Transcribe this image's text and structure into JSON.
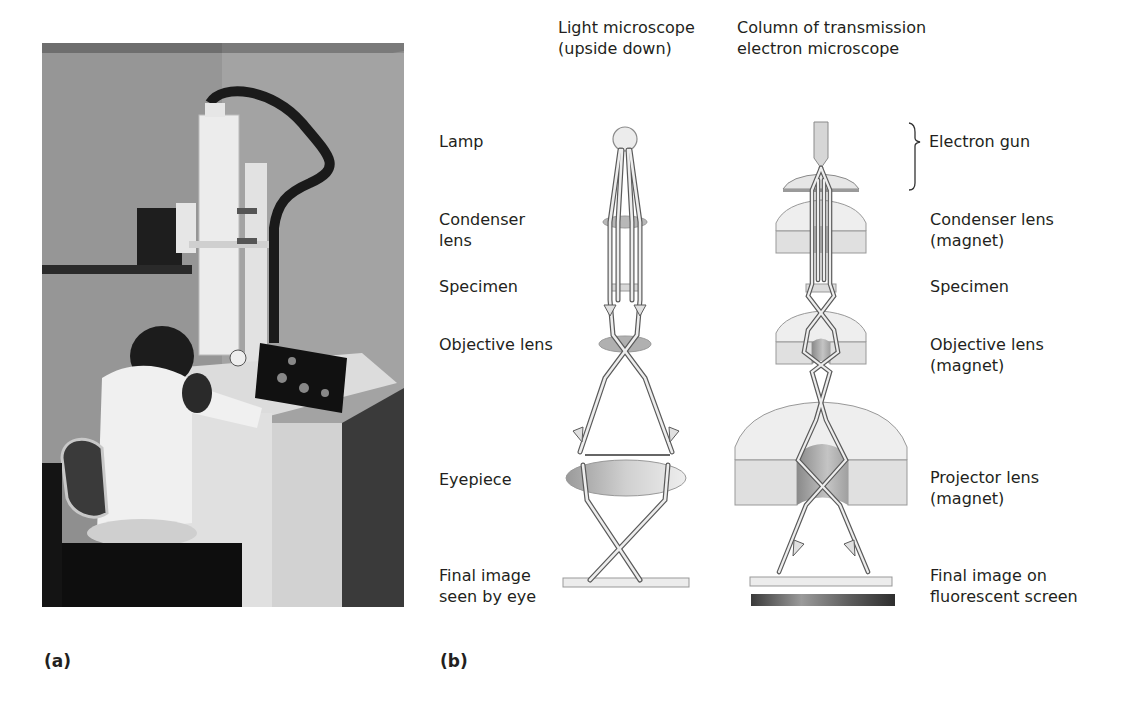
{
  "panels": {
    "a": {
      "label": "(a)",
      "content": "photograph of a researcher seated at a transmission electron microscope"
    },
    "b": {
      "label": "(b)"
    }
  },
  "headers": {
    "light_microscope": "Light microscope\n(upside down)",
    "tem_column": "Column of transmission\nelectron microscope"
  },
  "left_labels": {
    "lamp": "Lamp",
    "condenser": "Condenser\nlens",
    "specimen": "Specimen",
    "objective": "Objective lens",
    "eyepiece": "Eyepiece",
    "final_image": "Final image\nseen by eye"
  },
  "right_labels": {
    "electron_gun": "Electron gun",
    "condenser": "Condenser lens\n(magnet)",
    "specimen": "Specimen",
    "objective": "Objective lens\n(magnet)",
    "projector": "Projector lens\n(magnet)",
    "final_image": "Final image on\nfluorescent screen"
  },
  "colors": {
    "text": "#231f20",
    "lens_fill": "#c8c8c8",
    "magnet_fill": "#e4e4e4",
    "magnet_stroke": "#8c8c8c",
    "ray": "#e8e8e8",
    "ray_stroke": "#6a6a6a",
    "screen": "#555555"
  }
}
